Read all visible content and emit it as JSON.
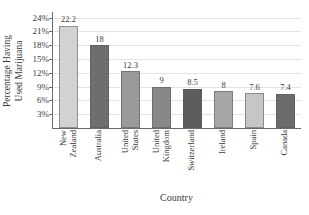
{
  "chart_data": {
    "type": "bar",
    "title": "",
    "xlabel": "Country",
    "ylabel_line1": "Percentage Having",
    "ylabel_line2": "Used Marijuana",
    "categories": [
      "New Zealand",
      "Australia",
      "United States",
      "United Kingdom",
      "Switzerland",
      "Ireland",
      "Spain",
      "Canada"
    ],
    "category_lines": [
      [
        "New",
        "Zealand"
      ],
      [
        "Australia",
        ""
      ],
      [
        "United",
        "States"
      ],
      [
        "United",
        "Kingdom"
      ],
      [
        "Switzerland",
        ""
      ],
      [
        "Ireland",
        ""
      ],
      [
        "Spain",
        ""
      ],
      [
        "Canada",
        ""
      ]
    ],
    "values": [
      22.2,
      18,
      12.3,
      9,
      8.5,
      8,
      7.6,
      7.4
    ],
    "value_labels": [
      "22.2",
      "18",
      "12.3",
      "9",
      "8.5",
      "8",
      "7.6",
      "7.4"
    ],
    "bar_colors": [
      "#d2d2d2",
      "#6e6e6e",
      "#9a9a9a",
      "#888888",
      "#5d5d5d",
      "#a6a6a6",
      "#c6c6c6",
      "#6b6b6b"
    ],
    "ylim": [
      0,
      25.2
    ],
    "yticks": [
      3,
      6,
      9,
      12,
      15,
      18,
      21,
      24
    ],
    "ytick_labels": [
      "3%",
      "6%",
      "9%",
      "12%",
      "15%",
      "18%",
      "21%",
      "24%"
    ],
    "grid": true,
    "legend": "none",
    "axis_color": "#6a6a6a",
    "grid_color": "#e3e3e3",
    "text_color": "#3a3a3a",
    "background": "#ffffff"
  }
}
